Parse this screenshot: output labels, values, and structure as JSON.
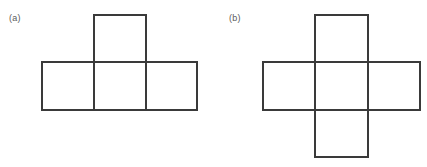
{
  "figure": {
    "background_color": "#ffffff",
    "stroke_color": "#3a3a3a",
    "stroke_width": 1.5,
    "label_color": "#5a5a5a",
    "panels": [
      {
        "id": "panel-a",
        "label": "(a)",
        "label_x": 9,
        "label_y": 14,
        "shape_name": "t-tetromino-net",
        "cell_size": 52,
        "squares": [
          {
            "name": "bottom-left-square",
            "x": 42,
            "y": 62,
            "w": 52,
            "h": 48
          },
          {
            "name": "bottom-middle-square",
            "x": 94,
            "y": 62,
            "w": 52,
            "h": 48
          },
          {
            "name": "bottom-right-square",
            "x": 146,
            "y": 62,
            "w": 51,
            "h": 48
          },
          {
            "name": "top-middle-square",
            "x": 94,
            "y": 15,
            "w": 52,
            "h": 47
          }
        ]
      },
      {
        "id": "panel-b",
        "label": "(b)",
        "label_x": 229,
        "label_y": 14,
        "shape_name": "plus-cross-net",
        "cell_size": 53,
        "squares": [
          {
            "name": "left-arm-square",
            "x": 263,
            "y": 62,
            "w": 52,
            "h": 48
          },
          {
            "name": "center-square",
            "x": 315,
            "y": 62,
            "w": 53,
            "h": 48
          },
          {
            "name": "right-arm-square",
            "x": 368,
            "y": 62,
            "w": 52,
            "h": 48
          },
          {
            "name": "top-arm-square",
            "x": 315,
            "y": 15,
            "w": 53,
            "h": 47
          },
          {
            "name": "bottom-arm-square",
            "x": 315,
            "y": 110,
            "w": 53,
            "h": 47
          }
        ]
      }
    ]
  }
}
